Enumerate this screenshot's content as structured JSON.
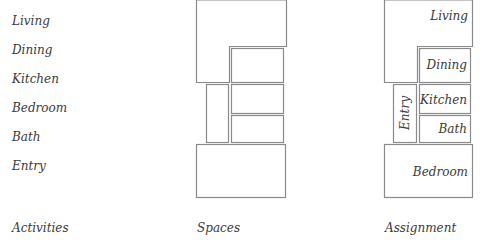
{
  "activities": {
    "caption": "Activities",
    "items": [
      "Living",
      "Dining",
      "Kitchen",
      "Bedroom",
      "Bath",
      "Entry"
    ]
  },
  "spaces": {
    "caption": "Spaces"
  },
  "assignment": {
    "caption": "Assignment",
    "rooms": {
      "living": "Living",
      "dining": "Dining",
      "kitchen": "Kitchen",
      "bath": "Bath",
      "entry": "Entry",
      "bedroom": "Bedroom"
    }
  },
  "colors": {
    "stroke": "#8a8a8a",
    "text": "#3a3a3a",
    "background": "#ffffff"
  }
}
